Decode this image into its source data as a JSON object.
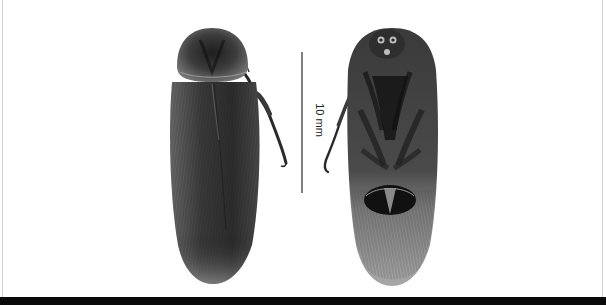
{
  "figure": {
    "views": [
      {
        "name": "dorsal view",
        "position": "left"
      },
      {
        "name": "ventral view",
        "position": "right"
      }
    ],
    "scale_bar": {
      "label": "10 mm",
      "color": "#2a2a2a"
    },
    "colors": {
      "background": "#ffffff",
      "specimen_dark": "#2b2b2b",
      "specimen_mid": "#5a5a5a",
      "specimen_light": "#9a9a9a",
      "bottom_bar": "#0a0a0a",
      "frame": "#cfcfcf"
    }
  }
}
